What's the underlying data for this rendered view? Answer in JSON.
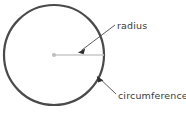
{
  "diagram": {
    "background_color": "#ffffff",
    "shape": {
      "name": "circle",
      "stroke_color": "#4a4a4a",
      "stroke_width": 2.2,
      "fill": "none",
      "center_x": 54,
      "center_y": 55,
      "radius": 50
    },
    "center_point": {
      "label": "center-dot",
      "color": "#bfbfbf",
      "x": 54,
      "y": 55,
      "size": 4
    },
    "radius_line": {
      "color": "#c9c9c9",
      "stroke_width": 1.6,
      "x1": 54,
      "y1": 55,
      "x2": 104,
      "y2": 55
    },
    "labels": [
      {
        "id": "radius",
        "text": "radius",
        "text_x": 117,
        "text_y": 29,
        "color": "#3b3b3b",
        "leader": {
          "color": "#4a4a4a",
          "stroke_width": 0.9,
          "from_x": 115,
          "from_y": 25,
          "to_x": 79,
          "to_y": 52
        }
      },
      {
        "id": "circumference",
        "text": "circumference",
        "text_x": 118,
        "text_y": 99,
        "color": "#3b3b3b",
        "leader": {
          "color": "#4a4a4a",
          "stroke_width": 0.9,
          "from_x": 116,
          "from_y": 94,
          "to_x": 97,
          "to_y": 76
        }
      }
    ]
  }
}
